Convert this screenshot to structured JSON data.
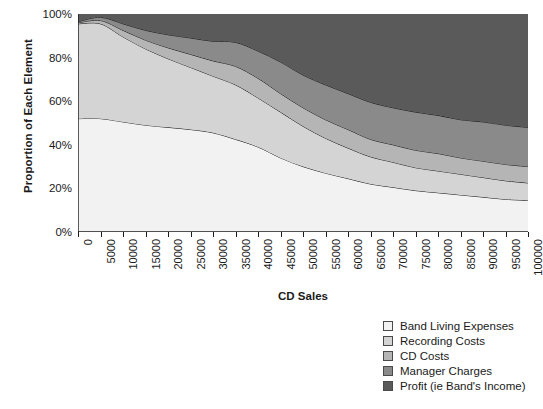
{
  "chart_data": {
    "type": "area",
    "title": "",
    "xlabel": "CD Sales",
    "ylabel": "Proportion of Each Element",
    "stacked": true,
    "normalized": true,
    "grid": false,
    "legend_position": "bottom-right",
    "xlim": [
      0,
      100000
    ],
    "ylim": [
      0,
      100
    ],
    "x_tick_labels": [
      "0",
      "5000",
      "10000",
      "15000",
      "20000",
      "25000",
      "30000",
      "35000",
      "40000",
      "45000",
      "50000",
      "55000",
      "60000",
      "65000",
      "70000",
      "75000",
      "80000",
      "85000",
      "90000",
      "95000",
      "100000"
    ],
    "y_tick_labels": [
      "0%",
      "20%",
      "40%",
      "60%",
      "80%",
      "100%"
    ],
    "y_ticks": [
      0,
      20,
      40,
      60,
      80,
      100
    ],
    "x": [
      0,
      5000,
      10000,
      15000,
      20000,
      25000,
      30000,
      35000,
      40000,
      45000,
      50000,
      55000,
      60000,
      65000,
      70000,
      75000,
      80000,
      85000,
      90000,
      95000,
      100000
    ],
    "series": [
      {
        "name": "Band Living Expenses",
        "color": "#f2f2f2",
        "values": [
          52,
          52,
          50.5,
          49,
          48,
          47,
          45.5,
          42.5,
          39,
          34,
          30,
          27,
          24.5,
          22,
          20.5,
          19,
          18,
          17,
          16,
          15,
          14.5
        ]
      },
      {
        "name": "Recording Costs",
        "color": "#d4d4d4",
        "values": [
          43.5,
          43.5,
          39,
          35,
          31.5,
          28.5,
          26,
          25,
          22.5,
          21,
          18.5,
          16,
          14,
          12.5,
          11.5,
          10.5,
          10,
          9.5,
          9,
          8.5,
          8
        ]
      },
      {
        "name": "CD Costs",
        "color": "#b5b5b5",
        "values": [
          0.5,
          1.5,
          3,
          4,
          5,
          6,
          7,
          8.5,
          9,
          8.5,
          8.5,
          8.5,
          8.5,
          8,
          8,
          8,
          8,
          7.5,
          7.5,
          7.5,
          7.5
        ]
      },
      {
        "name": "Manager Charges",
        "color": "#8a8a8a",
        "values": [
          0.5,
          1.5,
          3,
          4.5,
          6,
          7.5,
          9,
          11,
          12.5,
          14.5,
          15,
          16,
          16.5,
          17,
          17,
          17.5,
          17.5,
          17.5,
          18,
          18,
          18
        ]
      },
      {
        "name": "Profit (ie Band's Income)",
        "color": "#5a5a5a",
        "values": [
          3.5,
          1.5,
          4.5,
          7.5,
          9.5,
          11,
          12.5,
          13,
          17,
          22,
          28,
          32.5,
          36.5,
          40.5,
          43,
          45,
          46.5,
          48.5,
          49.5,
          51,
          52
        ]
      }
    ],
    "cumulative_boundaries": {
      "note": "upper edge of each stacked band, in percent",
      "band_living_expenses": [
        52,
        52,
        50.5,
        49,
        48,
        47,
        45.5,
        42.5,
        39,
        34,
        30,
        27,
        24.5,
        22,
        20.5,
        19,
        18,
        17,
        16,
        15,
        14.5
      ],
      "recording_costs": [
        95.5,
        95.5,
        89.5,
        84,
        79.5,
        75.5,
        71.5,
        67.5,
        61.5,
        55,
        48.5,
        43,
        38.5,
        34.5,
        32,
        29.5,
        28,
        26.5,
        25,
        23.5,
        22.5
      ],
      "cd_costs": [
        96,
        97,
        92.5,
        88,
        84.5,
        81.5,
        78.5,
        76,
        70.5,
        63.5,
        57,
        51.5,
        47,
        42.5,
        40,
        37.5,
        36,
        34,
        32.5,
        31,
        30
      ],
      "manager_charges": [
        96.5,
        98.5,
        95.5,
        92.5,
        90.5,
        89,
        87.5,
        87,
        83,
        78,
        72,
        67.5,
        63.5,
        59.5,
        57,
        55,
        53.5,
        51.5,
        50.5,
        49,
        48
      ],
      "profit": [
        100,
        100,
        100,
        100,
        100,
        100,
        100,
        100,
        100,
        100,
        100,
        100,
        100,
        100,
        100,
        100,
        100,
        100,
        100,
        100,
        100
      ]
    }
  },
  "legend": {
    "items": [
      {
        "label": "Band Living Expenses",
        "color": "#f2f2f2"
      },
      {
        "label": "Recording Costs",
        "color": "#d4d4d4"
      },
      {
        "label": "CD Costs",
        "color": "#b5b5b5"
      },
      {
        "label": "Manager Charges",
        "color": "#8a8a8a"
      },
      {
        "label": "Profit (ie Band's Income)",
        "color": "#5a5a5a"
      }
    ]
  }
}
